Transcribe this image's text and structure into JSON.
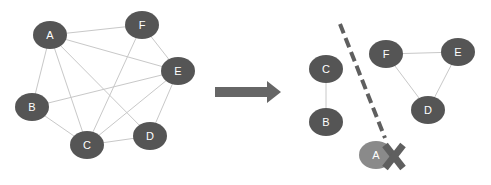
{
  "colors": {
    "node": "#555555",
    "removed_node": "#8a8a8a",
    "edge": "#c8c8c8",
    "arrow": "#666666",
    "cut_line": "#5f5f5f",
    "cross": "#5f5f5f"
  },
  "left_graph": {
    "nodes": [
      {
        "id": "A",
        "label": "A",
        "x": 50,
        "y": 35
      },
      {
        "id": "F",
        "label": "F",
        "x": 142,
        "y": 25
      },
      {
        "id": "E",
        "label": "E",
        "x": 178,
        "y": 71
      },
      {
        "id": "B",
        "label": "B",
        "x": 32,
        "y": 107
      },
      {
        "id": "C",
        "label": "C",
        "x": 87,
        "y": 145
      },
      {
        "id": "D",
        "label": "D",
        "x": 150,
        "y": 136
      }
    ],
    "edges": [
      [
        "A",
        "F"
      ],
      [
        "A",
        "E"
      ],
      [
        "A",
        "B"
      ],
      [
        "A",
        "C"
      ],
      [
        "A",
        "D"
      ],
      [
        "F",
        "C"
      ],
      [
        "F",
        "E"
      ],
      [
        "E",
        "B"
      ],
      [
        "E",
        "C"
      ],
      [
        "E",
        "D"
      ],
      [
        "B",
        "C"
      ],
      [
        "C",
        "D"
      ]
    ]
  },
  "arrow": {
    "label": "transforms-to"
  },
  "right_graph": {
    "nodes": [
      {
        "id": "C",
        "label": "C",
        "x": 326,
        "y": 69
      },
      {
        "id": "B",
        "label": "B",
        "x": 326,
        "y": 122
      },
      {
        "id": "F",
        "label": "F",
        "x": 386,
        "y": 54
      },
      {
        "id": "E",
        "label": "E",
        "x": 458,
        "y": 52
      },
      {
        "id": "D",
        "label": "D",
        "x": 428,
        "y": 110
      },
      {
        "id": "A",
        "label": "A",
        "x": 376,
        "y": 155,
        "removed": true
      }
    ],
    "edges": [
      [
        "C",
        "B"
      ],
      [
        "F",
        "E"
      ],
      [
        "F",
        "D"
      ],
      [
        "E",
        "D"
      ]
    ]
  }
}
